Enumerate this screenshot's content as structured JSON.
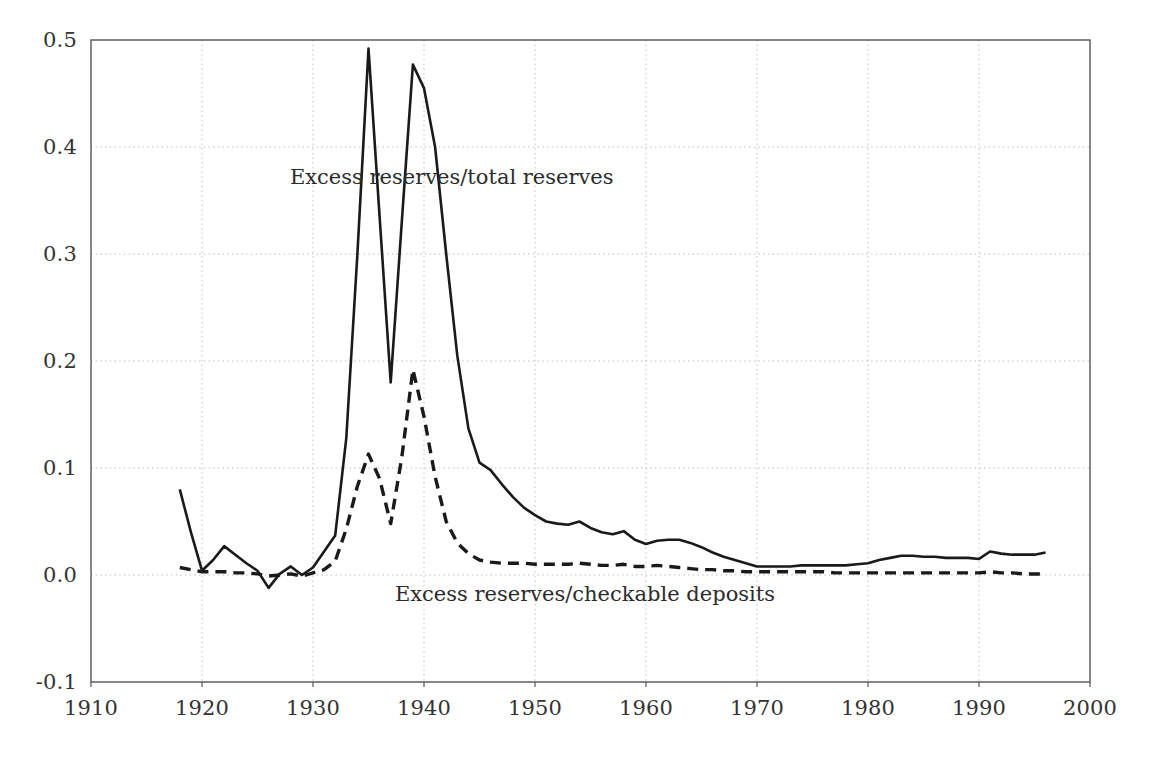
{
  "chart_data": {
    "type": "line",
    "title": "",
    "subtitle": "",
    "xlabel": "",
    "ylabel": "",
    "xlim": [
      1910,
      2000
    ],
    "ylim": [
      -0.1,
      0.5
    ],
    "grid": true,
    "legend_position": "inline-annotations",
    "x_ticks": [
      "1910",
      "1920",
      "1930",
      "1940",
      "1950",
      "1960",
      "1970",
      "1980",
      "1990",
      "2000"
    ],
    "y_ticks": [
      "-0.1",
      "0.0",
      "0.1",
      "0.2",
      "0.3",
      "0.4",
      "0.5"
    ],
    "x_tick_values": [
      1910,
      1920,
      1930,
      1940,
      1950,
      1960,
      1970,
      1980,
      1990,
      2000
    ],
    "y_tick_values": [
      -0.1,
      0.0,
      0.1,
      0.2,
      0.3,
      0.4,
      0.5
    ],
    "series": [
      {
        "name": "Excess reserves/total reserves",
        "style": "solid",
        "color": "#1a1a1a",
        "annotation": "Excess reserves/total reserves",
        "annotation_x": 1942.5,
        "annotation_y": 0.372,
        "x": [
          1918,
          1919,
          1920,
          1921,
          1922,
          1923,
          1924,
          1925,
          1926,
          1927,
          1928,
          1929,
          1930,
          1931,
          1932,
          1933,
          1934,
          1935,
          1936,
          1937,
          1938,
          1939,
          1940,
          1941,
          1942,
          1943,
          1944,
          1945,
          1946,
          1947,
          1948,
          1949,
          1950,
          1951,
          1952,
          1953,
          1954,
          1955,
          1956,
          1957,
          1958,
          1959,
          1960,
          1961,
          1962,
          1963,
          1964,
          1965,
          1966,
          1967,
          1968,
          1969,
          1970,
          1971,
          1972,
          1973,
          1974,
          1975,
          1976,
          1977,
          1978,
          1979,
          1980,
          1981,
          1982,
          1983,
          1984,
          1985,
          1986,
          1987,
          1988,
          1989,
          1990,
          1991,
          1992,
          1993,
          1994,
          1995,
          1996
        ],
        "y": [
          0.08,
          0.04,
          0.004,
          0.014,
          0.027,
          0.019,
          0.011,
          0.004,
          -0.012,
          0.001,
          0.008,
          0.0,
          0.007,
          0.022,
          0.037,
          0.128,
          0.3,
          0.492,
          0.335,
          0.18,
          0.33,
          0.477,
          0.455,
          0.4,
          0.3,
          0.205,
          0.137,
          0.105,
          0.098,
          0.085,
          0.073,
          0.063,
          0.056,
          0.05,
          0.048,
          0.047,
          0.05,
          0.044,
          0.04,
          0.038,
          0.041,
          0.033,
          0.029,
          0.032,
          0.033,
          0.033,
          0.03,
          0.026,
          0.021,
          0.017,
          0.014,
          0.011,
          0.008,
          0.008,
          0.008,
          0.008,
          0.009,
          0.009,
          0.009,
          0.009,
          0.009,
          0.01,
          0.011,
          0.014,
          0.016,
          0.018,
          0.018,
          0.017,
          0.017,
          0.016,
          0.016,
          0.016,
          0.015,
          0.022,
          0.02,
          0.019,
          0.019,
          0.019,
          0.021
        ]
      },
      {
        "name": "Excess reserves/checkable deposits",
        "style": "dashed",
        "color": "#1a1a1a",
        "annotation": "Excess reserves/checkable deposits",
        "annotation_x": 1954.5,
        "annotation_y": -0.018,
        "x": [
          1918,
          1919,
          1920,
          1921,
          1922,
          1923,
          1924,
          1925,
          1926,
          1927,
          1928,
          1929,
          1930,
          1931,
          1932,
          1933,
          1934,
          1935,
          1936,
          1937,
          1938,
          1939,
          1940,
          1941,
          1942,
          1943,
          1944,
          1945,
          1946,
          1947,
          1948,
          1949,
          1950,
          1951,
          1952,
          1953,
          1954,
          1955,
          1956,
          1957,
          1958,
          1959,
          1960,
          1961,
          1962,
          1963,
          1964,
          1965,
          1966,
          1967,
          1968,
          1969,
          1970,
          1971,
          1972,
          1973,
          1974,
          1975,
          1976,
          1977,
          1978,
          1979,
          1980,
          1981,
          1982,
          1983,
          1984,
          1985,
          1986,
          1987,
          1988,
          1989,
          1990,
          1991,
          1992,
          1993,
          1994,
          1995,
          1996
        ],
        "y": [
          0.007,
          0.005,
          0.003,
          0.003,
          0.003,
          0.002,
          0.002,
          0.001,
          -0.001,
          0.0,
          0.001,
          -0.001,
          0.002,
          0.005,
          0.013,
          0.043,
          0.083,
          0.113,
          0.09,
          0.048,
          0.11,
          0.192,
          0.148,
          0.092,
          0.05,
          0.03,
          0.02,
          0.014,
          0.012,
          0.011,
          0.011,
          0.011,
          0.01,
          0.01,
          0.01,
          0.01,
          0.011,
          0.01,
          0.009,
          0.009,
          0.01,
          0.008,
          0.008,
          0.009,
          0.008,
          0.007,
          0.006,
          0.005,
          0.005,
          0.004,
          0.004,
          0.003,
          0.003,
          0.003,
          0.003,
          0.003,
          0.003,
          0.003,
          0.003,
          0.002,
          0.002,
          0.002,
          0.002,
          0.002,
          0.002,
          0.002,
          0.002,
          0.002,
          0.002,
          0.002,
          0.002,
          0.002,
          0.002,
          0.003,
          0.002,
          0.002,
          0.001,
          0.001,
          0.001
        ]
      }
    ],
    "colors": {
      "axis": "#555555",
      "grid": "#bfbfbf",
      "line": "#1a1a1a",
      "text": "#333333",
      "background": "#ffffff"
    }
  }
}
